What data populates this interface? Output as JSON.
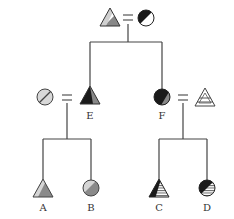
{
  "diagram": {
    "type": "pedigree",
    "colors": {
      "line": "#444444",
      "dark": "#1a1a1a",
      "grey": "#888888",
      "light": "#cfcfcf",
      "white": "#ffffff"
    },
    "individuals": [
      {
        "id": "P1",
        "label": "",
        "shape": "triangle",
        "fill": "half grey/dark diagonal"
      },
      {
        "id": "P2",
        "label": "",
        "shape": "circle",
        "fill": "half dark/white diagonal"
      },
      {
        "id": "E",
        "label": "E",
        "shape": "triangle",
        "fill": "dark/grey split"
      },
      {
        "id": "F",
        "label": "F",
        "shape": "circle",
        "fill": "dark/grey diagonal"
      },
      {
        "id": "S1",
        "label": "",
        "shape": "circle",
        "fill": "light grey hatched diagonal"
      },
      {
        "id": "S2",
        "label": "",
        "shape": "triangle",
        "fill": "white with horizontal stripes"
      },
      {
        "id": "A",
        "label": "A",
        "shape": "triangle",
        "fill": "grey with light hatched stripe"
      },
      {
        "id": "B",
        "label": "B",
        "shape": "circle",
        "fill": "grey/light hatched diagonal"
      },
      {
        "id": "C",
        "label": "C",
        "shape": "triangle",
        "fill": "dark/striped"
      },
      {
        "id": "D",
        "label": "D",
        "shape": "circle",
        "fill": "dark/striped"
      }
    ],
    "couples": [
      [
        "P1",
        "P2"
      ],
      [
        "S1",
        "E"
      ],
      [
        "F",
        "S2"
      ]
    ],
    "marriage_symbol": "=",
    "labels": {
      "E": "E",
      "F": "F",
      "A": "A",
      "B": "B",
      "C": "C",
      "D": "D"
    }
  }
}
